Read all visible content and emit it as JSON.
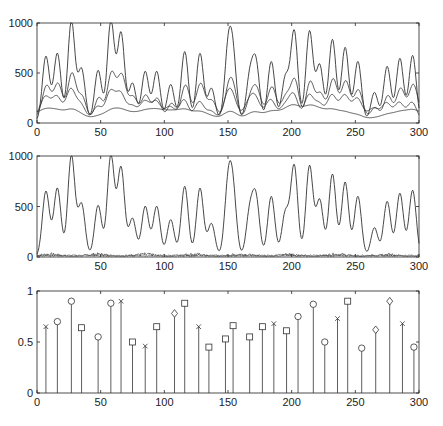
{
  "figure": {
    "width": 443,
    "height": 426,
    "line_color": "#333333",
    "axis_color": "#222222",
    "background": "#ffffff"
  },
  "chart_data": [
    {
      "type": "line",
      "panel": "top",
      "title": "",
      "xlabel": "",
      "ylabel": "",
      "xlim": [
        0,
        300
      ],
      "ylim": [
        0,
        1000
      ],
      "xticks": [
        0,
        50,
        100,
        150,
        200,
        250,
        300
      ],
      "yticks": [
        0,
        500,
        1000
      ],
      "grid": false,
      "legend": null,
      "series": [
        {
          "name": "signal",
          "description": "sum of all peaks (tallest trace)",
          "scale": 1.0,
          "baseline": 20
        },
        {
          "name": "component-a",
          "description": "mid-amplitude trace",
          "scale": 0.42,
          "baseline": 60
        },
        {
          "name": "component-b",
          "description": "lower trace",
          "scale": 0.3,
          "baseline": 40
        },
        {
          "name": "component-c",
          "description": "lowest smooth trace",
          "scale": 0.14,
          "baseline": 40
        }
      ]
    },
    {
      "type": "line",
      "panel": "middle",
      "title": "",
      "xlabel": "",
      "ylabel": "",
      "xlim": [
        0,
        300
      ],
      "ylim": [
        0,
        1000
      ],
      "xticks": [
        50,
        100,
        150,
        200,
        250,
        300
      ],
      "yticks": [
        0,
        500,
        1000
      ],
      "grid": false,
      "legend": null,
      "series": [
        {
          "name": "reconstruction",
          "description": "peak train, near-zero baseline",
          "scale": 1.0,
          "baseline": 0
        },
        {
          "name": "residual",
          "description": "noisy trace near zero",
          "scale": 0.0,
          "baseline": 10
        }
      ]
    },
    {
      "type": "stem",
      "panel": "bottom",
      "title": "",
      "xlabel": "",
      "ylabel": "",
      "xlim": [
        0,
        300
      ],
      "ylim": [
        0,
        1
      ],
      "xticks": [
        0,
        50,
        100,
        150,
        200,
        250,
        300
      ],
      "yticks": [
        0,
        0.5,
        1
      ],
      "grid": false,
      "legend": null,
      "x": [
        7,
        16,
        27,
        35,
        48,
        58,
        66,
        75,
        85,
        94,
        108,
        116,
        127,
        135,
        148,
        154,
        167,
        177,
        186,
        196,
        205,
        217,
        226,
        236,
        244,
        255,
        266,
        277,
        287,
        296
      ],
      "values": [
        0.65,
        0.7,
        0.9,
        0.64,
        0.55,
        0.88,
        0.9,
        0.5,
        0.46,
        0.65,
        0.78,
        0.88,
        0.65,
        0.45,
        0.53,
        0.66,
        0.55,
        0.65,
        0.68,
        0.61,
        0.75,
        0.87,
        0.5,
        0.73,
        0.9,
        0.44,
        0.62,
        0.9,
        0.68,
        0.45
      ],
      "markers": [
        "x",
        "o",
        "o",
        "s",
        "o",
        "o",
        "x",
        "s",
        "x",
        "s",
        "d",
        "s",
        "x",
        "s",
        "s",
        "s",
        "s",
        "s",
        "x",
        "s",
        "o",
        "o",
        "o",
        "x",
        "s",
        "o",
        "d",
        "d",
        "x",
        "o"
      ]
    }
  ],
  "peaks": {
    "description": "Peak centers/heights of the main traces in top and middle panels",
    "x": [
      7,
      16,
      27,
      35,
      48,
      58,
      66,
      75,
      85,
      94,
      105,
      116,
      128,
      137,
      150,
      154,
      167,
      172,
      184,
      195,
      202,
      214,
      222,
      232,
      242,
      252,
      265,
      275,
      285,
      295
    ],
    "heights": [
      650,
      680,
      1000,
      520,
      510,
      1000,
      880,
      380,
      500,
      500,
      370,
      700,
      680,
      330,
      650,
      580,
      420,
      560,
      600,
      430,
      900,
      900,
      560,
      820,
      740,
      600,
      290,
      550,
      630,
      660
    ]
  },
  "panels": {
    "top": {
      "left": 37,
      "right": 419,
      "top": 23,
      "bottom": 123
    },
    "middle": {
      "left": 37,
      "right": 419,
      "top": 156,
      "bottom": 257
    },
    "bottom": {
      "left": 37,
      "right": 419,
      "top": 291,
      "bottom": 393
    }
  }
}
